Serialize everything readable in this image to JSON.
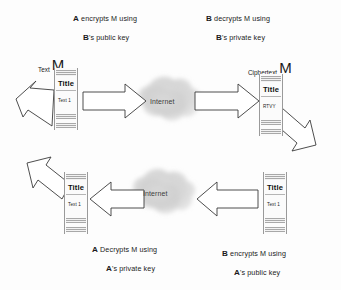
{
  "diagram": {
    "background_color": "#fdfdfd",
    "stroke_color": "#3a3a3a",
    "width": 341,
    "height": 290
  },
  "captions": {
    "top_left": {
      "line1_bold": "A",
      "line1_rest": " encrypts M using",
      "line2_bold": "B",
      "line2_rest": "'s public key"
    },
    "top_right": {
      "line1_bold": "B",
      "line1_rest": " decrypts M using",
      "line2_bold": "B",
      "line2_rest": "'s private key"
    },
    "bottom_left": {
      "line1_bold": "A",
      "line1_rest": " Decrypts M using",
      "line2_bold": "A",
      "line2_rest": "'s private key"
    },
    "bottom_right": {
      "line1_bold": "B",
      "line1_rest": " encrypts M using",
      "line2_bold": "A",
      "line2_rest": "'s public key"
    }
  },
  "labels": {
    "plaintext": {
      "small": "Text",
      "big": "M"
    },
    "ciphertext": {
      "small": "Ciphertext",
      "big": "M"
    }
  },
  "documents": {
    "plaintext_out": {
      "title": "Title",
      "body": "Text 1"
    },
    "ciphertext_in": {
      "title": "Title",
      "body": "RTVY"
    },
    "plaintext_final": {
      "title": "Title",
      "body": "Text 1"
    },
    "plaintext_reply": {
      "title": "Title",
      "body": "Text 1"
    }
  },
  "clouds": {
    "top": {
      "label": "Internet"
    },
    "bottom": {
      "label": "Internet"
    }
  },
  "arrows": [
    {
      "name": "arrow-inbound-plaintext",
      "direction": "up-right",
      "kind": "diagonal-block"
    },
    {
      "name": "arrow-plaintext-to-internet",
      "direction": "right",
      "kind": "horizontal-block"
    },
    {
      "name": "arrow-internet-to-ciphertext",
      "direction": "right",
      "kind": "horizontal-block"
    },
    {
      "name": "arrow-ciphertext-down",
      "direction": "down-right",
      "kind": "diagonal-block"
    },
    {
      "name": "arrow-reply-to-internet",
      "direction": "left",
      "kind": "horizontal-block"
    },
    {
      "name": "arrow-internet-to-final",
      "direction": "left",
      "kind": "horizontal-block"
    },
    {
      "name": "arrow-outbound-final",
      "direction": "up-left",
      "kind": "diagonal-block"
    }
  ]
}
